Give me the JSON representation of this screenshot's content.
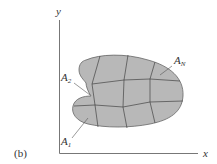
{
  "figure": {
    "caption": "(b)",
    "axes": {
      "x_label": "x",
      "y_label": "y"
    },
    "region": {
      "fill_color": "#b8b8b8",
      "stroke_color": "#555555",
      "labels": [
        {
          "id": "A1",
          "main": "A",
          "sub": "1"
        },
        {
          "id": "A2",
          "main": "A",
          "sub": "2"
        },
        {
          "id": "AN",
          "main": "A",
          "sub": "N"
        }
      ]
    }
  }
}
